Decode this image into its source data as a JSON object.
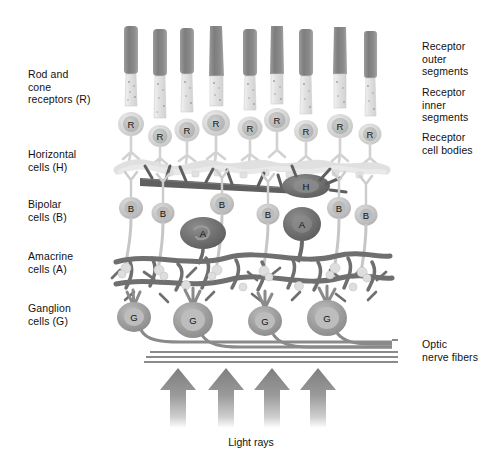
{
  "figure": {
    "background_color": "#ffffff"
  },
  "labels_left": [
    {
      "id": "rod-cone-receptors",
      "text": "Rod and\ncone\nreceptors (R)",
      "x": 28,
      "y": 68
    },
    {
      "id": "horizontal-cells",
      "text": "Horizontal\ncells (H)",
      "x": 28,
      "y": 148
    },
    {
      "id": "bipolar-cells",
      "text": "Bipolar\ncells (B)",
      "x": 28,
      "y": 198
    },
    {
      "id": "amacrine-cells",
      "text": "Amacrine\ncells (A)",
      "x": 28,
      "y": 250
    },
    {
      "id": "ganglion-cells",
      "text": "Ganglion\ncells (G)",
      "x": 28,
      "y": 302
    }
  ],
  "labels_right": [
    {
      "id": "receptor-outer-segments",
      "text": "Receptor\nouter\nsegments",
      "x": 422,
      "y": 40
    },
    {
      "id": "receptor-inner-segments",
      "text": "Receptor\ninner\nsegments",
      "x": 422,
      "y": 86
    },
    {
      "id": "receptor-cell-bodies",
      "text": "Receptor\ncell bodies",
      "x": 422,
      "y": 131
    },
    {
      "id": "optic-nerve-fibers",
      "text": "Optic\nnerve fibers",
      "x": 422,
      "y": 338
    }
  ],
  "caption": {
    "id": "light-rays",
    "text": "Light rays",
    "x": 251,
    "y": 436
  },
  "colors": {
    "outer_segment": "#8d8d8d",
    "outer_segment_dark": "#7b7b7b",
    "inner_segment": "#e8e8e8",
    "inner_segment_edge": "#cfcfcf",
    "receptor_body": "#dcdcdc",
    "receptor_nucleus": "#bdbdbd",
    "horizontal_cell": "#6a6a6a",
    "horizontal_cell_nucleus": "#8a8a8a",
    "bipolar_cell": "#c4c4c4",
    "bipolar_nucleus": "#a8a8a8",
    "amacrine_cell": "#6f6f6f",
    "amacrine_nucleus": "#8f8f8f",
    "ganglion_cell": "#9a9a9a",
    "ganglion_nucleus": "#bcbcbc",
    "plexus": "#7a7a7a",
    "nerve_fiber": "#8a8a8a",
    "arrow": "#8f8f8f",
    "text": "#111111"
  },
  "structures": {
    "receptors": [
      {
        "index": 1,
        "x": 131,
        "outer_top": 26,
        "outer_bottom": 74,
        "body_y": 124,
        "letter": "R"
      },
      {
        "index": 2,
        "x": 160,
        "outer_top": 29,
        "outer_bottom": 76,
        "body_y": 136,
        "letter": "R"
      },
      {
        "index": 3,
        "x": 187,
        "outer_top": 28,
        "outer_bottom": 74,
        "body_y": 130,
        "letter": "R"
      },
      {
        "index": 4,
        "x": 216,
        "outer_top": 26,
        "outer_bottom": 76,
        "body_y": 123,
        "letter": "R"
      },
      {
        "index": 5,
        "x": 250,
        "outer_top": 29,
        "outer_bottom": 76,
        "body_y": 128,
        "letter": "R"
      },
      {
        "index": 6,
        "x": 277,
        "outer_top": 26,
        "outer_bottom": 74,
        "body_y": 120,
        "letter": "R"
      },
      {
        "index": 7,
        "x": 306,
        "outer_top": 29,
        "outer_bottom": 76,
        "body_y": 131,
        "letter": "R"
      },
      {
        "index": 8,
        "x": 340,
        "outer_top": 27,
        "outer_bottom": 74,
        "body_y": 126,
        "letter": "R"
      },
      {
        "index": 9,
        "x": 370,
        "outer_top": 31,
        "outer_bottom": 78,
        "body_y": 134,
        "letter": "R"
      }
    ],
    "horizontal_cells": [
      {
        "index": 1,
        "x": 306,
        "y": 185,
        "letter": "H"
      }
    ],
    "bipolar_cells": [
      {
        "index": 1,
        "x": 131,
        "y": 208,
        "letter": "B"
      },
      {
        "index": 2,
        "x": 163,
        "y": 213,
        "letter": "B"
      },
      {
        "index": 3,
        "x": 222,
        "y": 204,
        "letter": "B"
      },
      {
        "index": 4,
        "x": 268,
        "y": 214,
        "letter": "B"
      },
      {
        "index": 5,
        "x": 339,
        "y": 208,
        "letter": "B"
      },
      {
        "index": 6,
        "x": 366,
        "y": 215,
        "letter": "B"
      }
    ],
    "amacrine_cells": [
      {
        "index": 1,
        "x": 203,
        "y": 233,
        "letter": "A"
      },
      {
        "index": 2,
        "x": 302,
        "y": 224,
        "letter": "A"
      }
    ],
    "ganglion_cells": [
      {
        "index": 1,
        "x": 134,
        "y": 317,
        "letter": "G"
      },
      {
        "index": 2,
        "x": 193,
        "y": 320,
        "letter": "G"
      },
      {
        "index": 3,
        "x": 265,
        "y": 321,
        "letter": "G"
      },
      {
        "index": 4,
        "x": 327,
        "y": 318,
        "letter": "G"
      }
    ],
    "nerve_fiber_lines": [
      {
        "index": 1,
        "y": 340
      },
      {
        "index": 2,
        "y": 344
      },
      {
        "index": 3,
        "y": 348
      },
      {
        "index": 4,
        "y": 352
      },
      {
        "index": 5,
        "y": 356
      },
      {
        "index": 6,
        "y": 360
      }
    ],
    "light_ray_arrows": [
      {
        "index": 1,
        "x": 178,
        "tip_y": 365,
        "base_y": 425
      },
      {
        "index": 2,
        "x": 226,
        "tip_y": 365,
        "base_y": 425
      },
      {
        "index": 3,
        "x": 272,
        "tip_y": 365,
        "base_y": 425
      },
      {
        "index": 4,
        "x": 318,
        "tip_y": 365,
        "base_y": 425
      }
    ]
  }
}
